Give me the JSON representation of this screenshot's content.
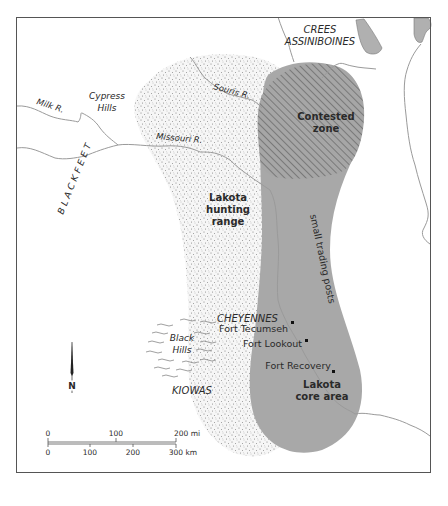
{
  "map": {
    "regions": {
      "contested": {
        "line1": "Contested",
        "line2": "zone"
      },
      "hunting": {
        "line1": "Lakota",
        "line2": "hunting",
        "line3": "range"
      },
      "core": {
        "line1": "Lakota",
        "line2": "core area"
      },
      "trading_posts": "small trading posts"
    },
    "tribes": {
      "crees": "CREES",
      "assiniboines": "ASSINIBOINES",
      "blackfeet": "BLACKFEET",
      "cheyennes": "CHEYENNES",
      "kiowas": "KIOWAS"
    },
    "rivers": {
      "milk": "Milk R.",
      "missouri": "Missouri R.",
      "souris": "Souris R."
    },
    "landmarks": {
      "cypress_line1": "Cypress",
      "cypress_line2": "Hills",
      "black_line1": "Black",
      "black_line2": "Hills"
    },
    "forts": [
      {
        "name": "Fort Tecumseh"
      },
      {
        "name": "Fort Lookout"
      },
      {
        "name": "Fort Recovery"
      }
    ],
    "north_arrow": "N",
    "scale_bar": {
      "miles": [
        "0",
        "100",
        "200 mi"
      ],
      "km": [
        "0",
        "100",
        "200",
        "300 km"
      ]
    },
    "colors": {
      "core_fill": "#a8a8a8",
      "stipple": "#8a8a8a",
      "river": "#9a9a9a",
      "frame": "#555555",
      "lake": "#b0b0b0"
    }
  }
}
